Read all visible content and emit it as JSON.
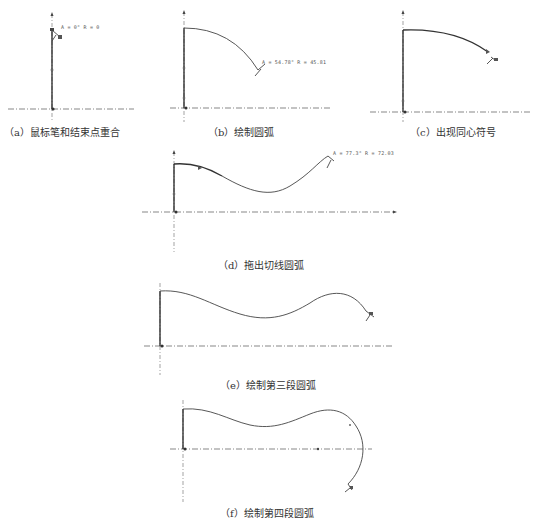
{
  "figure": {
    "panels": [
      {
        "id": "a",
        "caption": "（a）鼠标笔和结束点重合",
        "dimension": "A = 0°  R = 0"
      },
      {
        "id": "b",
        "caption": "（b）绘制圆弧",
        "dimension": "A = 54.78°  R = 45.81"
      },
      {
        "id": "c",
        "caption": "（c）出现同心符号",
        "dimension": ""
      },
      {
        "id": "d",
        "caption": "（d）拖出切线圆弧",
        "dimension": "A = 77.3°  R = 72.03"
      },
      {
        "id": "e",
        "caption": "（e）绘制第三段圆弧",
        "dimension": ""
      },
      {
        "id": "f",
        "caption": "（f）绘制第四段圆弧",
        "dimension": ""
      }
    ],
    "colors": {
      "background": "#ffffff",
      "stroke": "#333333",
      "text": "#333333"
    },
    "icons": {
      "cursor": "pencil-cursor-icon",
      "origin": "origin-marker-icon",
      "concentric": "concentric-symbol-icon"
    }
  }
}
